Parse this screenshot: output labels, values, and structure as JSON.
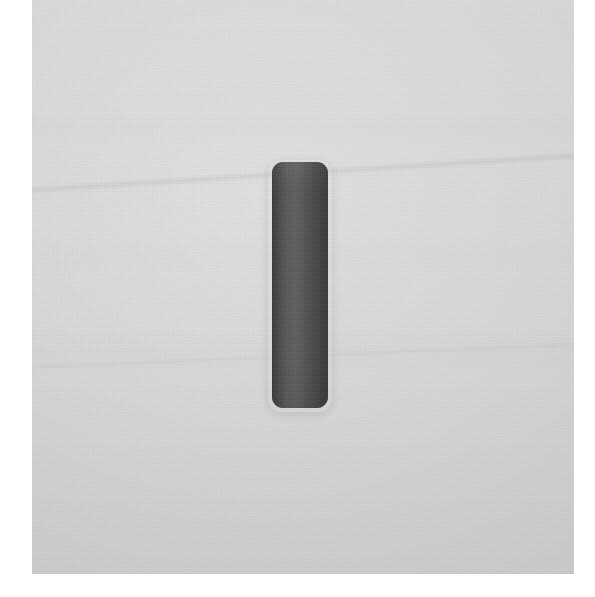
{
  "image": {
    "kind": "scanned-photograph",
    "caption": "A single dark grey vertical rounded object on a light grey scanned background",
    "width_px": 595,
    "height_px": 597
  },
  "page": {
    "background_color": "#ffffff"
  },
  "surface": {
    "name": "scan-surface",
    "color": "#d9d9d9",
    "left_px": 32,
    "top_px": 0,
    "width_px": 542,
    "height_px": 574,
    "texture": "fine paper grain with faint horizontal banding"
  },
  "object": {
    "name": "dark-vertical-bar",
    "color": "#4b4b4b",
    "shape": "rounded-rectangle",
    "corner_radius_px": 11,
    "left_px": 272,
    "top_px": 162,
    "width_px": 56,
    "height_px": 246,
    "orientation": "vertical"
  },
  "artifacts": {
    "crease_primary": {
      "name": "diagonal-crease-upper",
      "top_px": 150,
      "opacity": 0.055
    },
    "crease_secondary": {
      "name": "diagonal-crease-lower",
      "top_px": 336,
      "opacity": 0.028
    }
  }
}
